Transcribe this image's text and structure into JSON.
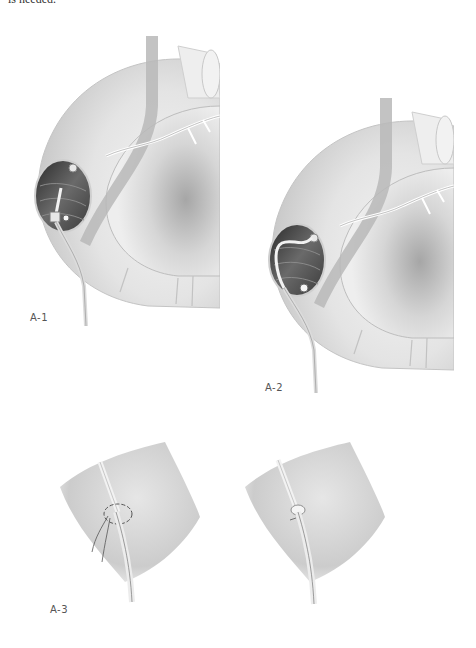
{
  "page": {
    "top_text": "is needed.",
    "figures": [
      {
        "id": "A-1",
        "label": "A-1",
        "description": "Colon with opening showing catheter inserted into lumen, vessels in mesentery"
      },
      {
        "id": "A-2",
        "label": "A-2",
        "description": "Colon with opening showing catheter looped inside lumen"
      },
      {
        "id": "A-3",
        "label": "A-3",
        "description": "Catheter passing through bowel wall secured with purse-string suture (left: loose, right: tied)"
      }
    ]
  },
  "colors": {
    "background": "#ffffff",
    "tissue_light": "#e9e9e9",
    "tissue_mid": "#d2d2d2",
    "tissue_shadow": "#a9a9a9",
    "lumen_dark": "#3a3a3a",
    "vessel_band": "#b5b5b5",
    "label_text": "#555555"
  }
}
